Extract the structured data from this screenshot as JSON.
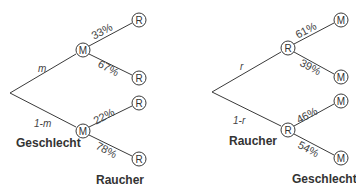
{
  "tree_left": {
    "root_edges": [
      {
        "label": "m"
      },
      {
        "label": "1-m"
      }
    ],
    "level1_node": "M",
    "leaf_node": "R",
    "branch_top": [
      "33%",
      "67%"
    ],
    "branch_bottom": [
      "22%",
      "78%"
    ],
    "level_labels": {
      "first": "Geschlecht",
      "second": "Raucher"
    }
  },
  "tree_right": {
    "root_edges": [
      {
        "label": "r"
      },
      {
        "label": "1-r"
      }
    ],
    "level1_node": "R",
    "leaf_node": "M",
    "branch_top": [
      "61%",
      "39%"
    ],
    "branch_bottom": [
      "46%",
      "54%"
    ],
    "level_labels": {
      "first": "Raucher",
      "second": "Geschlecht"
    }
  }
}
